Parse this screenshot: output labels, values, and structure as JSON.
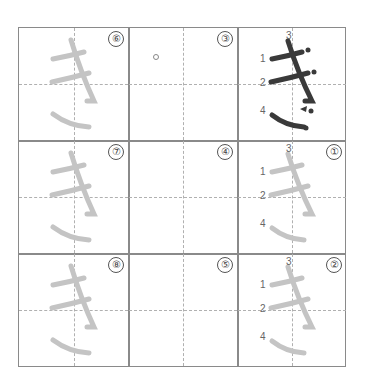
{
  "worksheet": {
    "character": "き",
    "stroke_labels": [
      "1",
      "2",
      "3",
      "4"
    ],
    "cells": [
      {
        "row": 0,
        "col": 0,
        "index": "⑥",
        "type": "trace"
      },
      {
        "row": 0,
        "col": 1,
        "index": "③",
        "type": "blank",
        "mark": "small-circle"
      },
      {
        "row": 0,
        "col": 2,
        "index": "",
        "type": "model"
      },
      {
        "row": 1,
        "col": 0,
        "index": "⑦",
        "type": "trace"
      },
      {
        "row": 1,
        "col": 1,
        "index": "④",
        "type": "blank"
      },
      {
        "row": 1,
        "col": 2,
        "index": "①",
        "type": "trace-numbered"
      },
      {
        "row": 2,
        "col": 0,
        "index": "⑧",
        "type": "trace"
      },
      {
        "row": 2,
        "col": 1,
        "index": "⑤",
        "type": "blank"
      },
      {
        "row": 2,
        "col": 2,
        "index": "②",
        "type": "trace-numbered"
      }
    ],
    "colors": {
      "model": "#3a3a3a",
      "trace": "#c4c4c4",
      "grid": "#8a8a8a",
      "guide": "#b0b0b0"
    }
  }
}
